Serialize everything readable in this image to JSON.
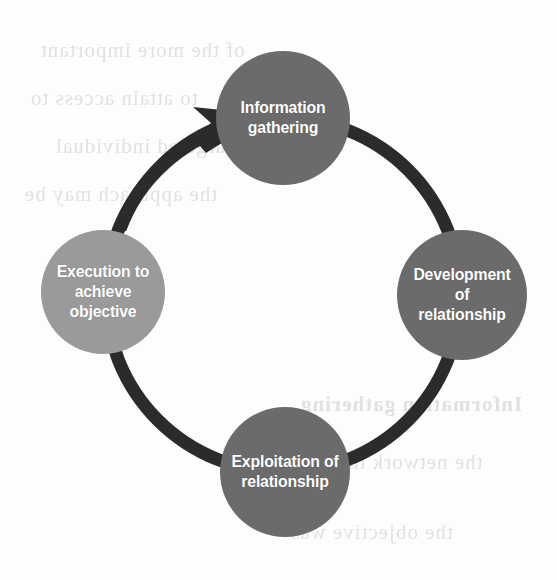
{
  "diagram": {
    "type": "cycle",
    "direction": "clockwise",
    "background_color": "#fdfdfd",
    "ring": {
      "color": "#2b2b2b",
      "thickness": 13,
      "center_x": 283,
      "center_y": 295,
      "radius": 177
    },
    "arrow": {
      "color": "#2b2b2b",
      "points_to": "Information gathering",
      "tip_x": 237,
      "tip_y": 118
    },
    "nodes": [
      {
        "id": "information-gathering",
        "lines": [
          "Information",
          "gathering"
        ],
        "line1": "Information",
        "line2": "gathering",
        "line3": "",
        "fill": "#6b6b6b",
        "text_color": "#ffffff",
        "cx": 283,
        "cy": 118,
        "r": 67,
        "position": "top",
        "order": 1
      },
      {
        "id": "development-of-relationship",
        "lines": [
          "Development",
          "of",
          "relationship"
        ],
        "line1": "Development",
        "line2": "of",
        "line3": "relationship",
        "fill": "#6b6b6b",
        "text_color": "#ffffff",
        "cx": 462,
        "cy": 295,
        "r": 65,
        "position": "right",
        "order": 2
      },
      {
        "id": "exploitation-of-relationship",
        "lines": [
          "Exploitation of",
          "relationship"
        ],
        "line1": "Exploitation of",
        "line2": "relationship",
        "line3": "",
        "fill": "#6b6b6b",
        "text_color": "#ffffff",
        "cx": 285,
        "cy": 472,
        "r": 65,
        "position": "bottom",
        "order": 3
      },
      {
        "id": "execution-to-achieve-objective",
        "lines": [
          "Execution to",
          "achieve",
          "objective"
        ],
        "line1": "Execution to",
        "line2": "achieve",
        "line3": "objective",
        "fill": "#9a9a9a",
        "text_color": "#ffffff",
        "cx": 103,
        "cy": 292,
        "r": 62,
        "position": "left",
        "order": 4
      }
    ]
  },
  "page_bleed": {
    "note": "faint mirrored show-through text from reverse of scanned page",
    "lines": [
      "of the more important",
      "to attain access to",
      "and the targeted individual",
      "the approach may be",
      "Information gathering",
      "the network that",
      "the objective was"
    ]
  }
}
